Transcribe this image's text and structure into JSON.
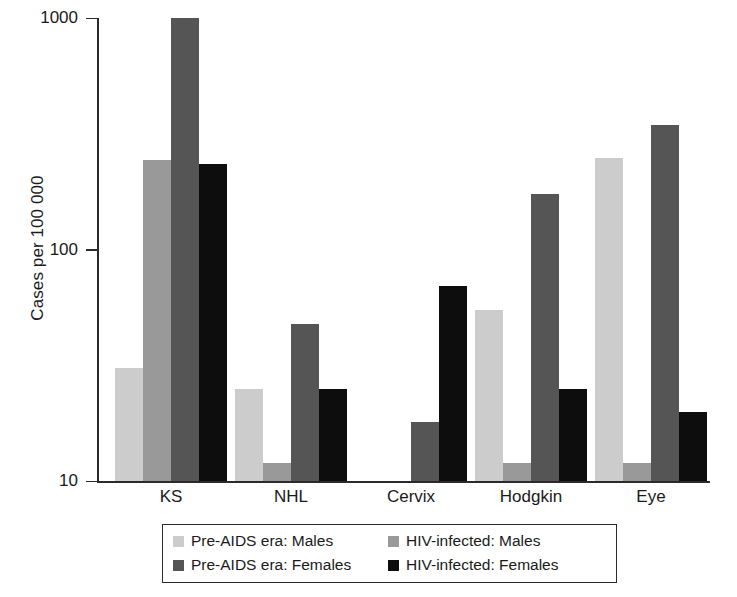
{
  "chart_data": {
    "type": "bar",
    "title": "",
    "xlabel": "",
    "ylabel": "Cases per 100 000",
    "yscale": "log",
    "ylim": [
      10,
      1000
    ],
    "ytick_labels": [
      "10",
      "100",
      "1000"
    ],
    "ytick_values": [
      10,
      100,
      1000
    ],
    "grid": false,
    "legend_position": "bottom",
    "categories": [
      "KS",
      "NHL",
      "Cervix",
      "Hodgkin",
      "Eye"
    ],
    "series": [
      {
        "name": "Pre-AIDS era: Males",
        "color": "#cccccc",
        "values": [
          31,
          25,
          null,
          55,
          250
        ]
      },
      {
        "name": "HIV-infected: Males",
        "color": "#999999",
        "values": [
          245,
          12,
          null,
          12,
          12
        ]
      },
      {
        "name": "Pre-AIDS era: Females",
        "color": "#555555",
        "values": [
          1000,
          48,
          18,
          175,
          345
        ]
      },
      {
        "name": "HIV-infected: Females",
        "color": "#0d0d0d",
        "values": [
          235,
          25,
          70,
          25,
          20
        ]
      }
    ]
  }
}
